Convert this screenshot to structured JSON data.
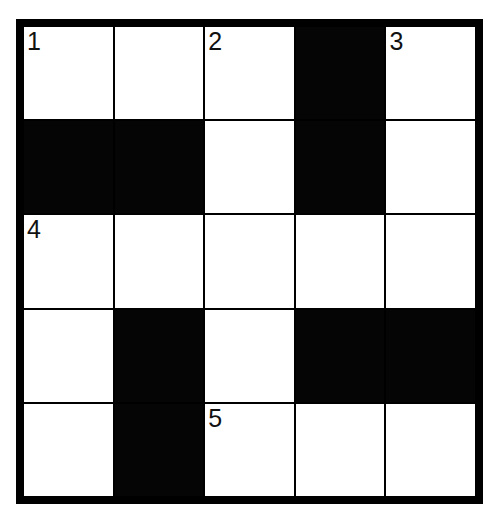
{
  "puzzle": {
    "rows": 5,
    "cols": 5,
    "grid": [
      [
        {
          "black": false,
          "num": "1"
        },
        {
          "black": false,
          "num": ""
        },
        {
          "black": false,
          "num": "2"
        },
        {
          "black": true,
          "num": ""
        },
        {
          "black": false,
          "num": "3"
        }
      ],
      [
        {
          "black": true,
          "num": ""
        },
        {
          "black": true,
          "num": ""
        },
        {
          "black": false,
          "num": ""
        },
        {
          "black": true,
          "num": ""
        },
        {
          "black": false,
          "num": ""
        }
      ],
      [
        {
          "black": false,
          "num": "4"
        },
        {
          "black": false,
          "num": ""
        },
        {
          "black": false,
          "num": ""
        },
        {
          "black": false,
          "num": ""
        },
        {
          "black": false,
          "num": ""
        }
      ],
      [
        {
          "black": false,
          "num": ""
        },
        {
          "black": true,
          "num": ""
        },
        {
          "black": false,
          "num": ""
        },
        {
          "black": true,
          "num": ""
        },
        {
          "black": true,
          "num": ""
        }
      ],
      [
        {
          "black": false,
          "num": ""
        },
        {
          "black": true,
          "num": ""
        },
        {
          "black": false,
          "num": "5"
        },
        {
          "black": false,
          "num": ""
        },
        {
          "black": false,
          "num": ""
        }
      ]
    ]
  },
  "colors": {
    "block": "#050505",
    "cell": "#ffffff",
    "grid_line": "#000000"
  }
}
